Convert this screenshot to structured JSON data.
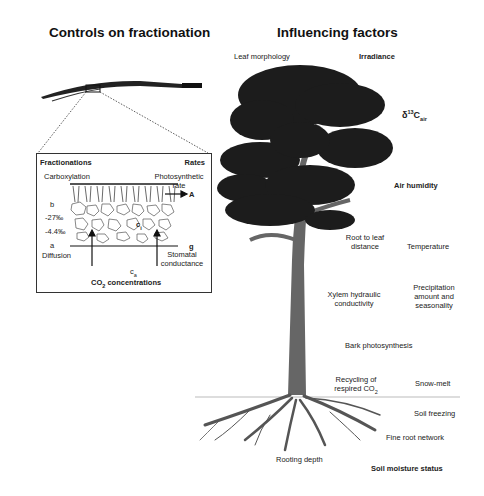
{
  "left_panel": {
    "title": "Controls on fractionation",
    "inset": {
      "header_left": "Fractionations",
      "header_right": "Rates",
      "carboxylation": "Carboxylation",
      "photosynthetic_rate": "Photosynthetic rate",
      "b_symbol": "b",
      "b_value": "-27‰",
      "a_value": "-4.4‰",
      "a_symbol": "a",
      "diffusion": "Diffusion",
      "rate_A": "A",
      "ci_label": "c",
      "ci_sub": "i",
      "rate_g": "g",
      "stomatal": "Stomatal conductance",
      "ca_label": "c",
      "ca_sub": "a",
      "co2_title_prefix": "CO",
      "co2_sub": "2",
      "co2_title_suffix": " concentrations"
    }
  },
  "right_panel": {
    "title": "Influencing factors",
    "labels": {
      "leaf_morphology": "Leaf morphology",
      "irradiance": "Irradiance",
      "delta_prefix": "δ",
      "delta_sup": "13",
      "delta_c": "C",
      "delta_sub": "air",
      "air_humidity": "Air humidity",
      "root_to_leaf_1": "Root to leaf",
      "root_to_leaf_2": "distance",
      "temperature": "Temperature",
      "xylem_1": "Xylem hydraulic",
      "xylem_2": "conductivity",
      "precip_1": "Precipitation",
      "precip_2": "amount and",
      "precip_3": "seasonality",
      "bark": "Bark photosynthesis",
      "recycling_1": "Recycling of",
      "recycling_2_prefix": "respired CO",
      "recycling_sub": "2",
      "snow_melt": "Snow-melt",
      "soil_freezing": "Soil freezing",
      "fine_root": "Fine root network",
      "rooting_depth": "Rooting depth",
      "soil_moisture": "Soil moisture status"
    }
  }
}
